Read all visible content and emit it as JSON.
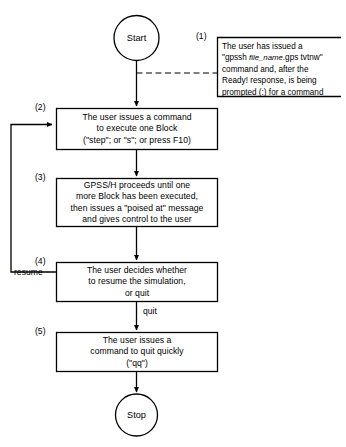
{
  "diagram": {
    "background_color": "#ffffff",
    "line_color": "#000000"
  },
  "terminals": {
    "start": "Start",
    "stop": "Stop"
  },
  "steps": [
    {
      "number": "(1)",
      "kind": "note",
      "lines_html": [
        "The user has issued a",
        "\"gpssh <i>file_name</i>.gps tvtnw\"",
        "command and, after the",
        "Ready! response, is being",
        "prompted (:) for a command"
      ],
      "lines_text": [
        "The user has issued a",
        "\"gpssh file_name.gps tvtnw\"",
        "command and, after the",
        "Ready! response, is being",
        "prompted (:) for a command"
      ]
    },
    {
      "number": "(2)",
      "kind": "process",
      "lines": [
        "The user  issues a command",
        "to execute one Block",
        "(\"step\"; or \"s\"; or press F10)"
      ]
    },
    {
      "number": "(3)",
      "kind": "process",
      "lines": [
        "GPSS/H proceeds until one",
        "more Block has been executed,",
        "then issues a \"poised at\" message",
        "and gives control to the user"
      ]
    },
    {
      "number": "(4)",
      "kind": "process",
      "lines": [
        "The user decides whether",
        "to resume the simulation,",
        "or quit"
      ]
    },
    {
      "number": "(5)",
      "kind": "process",
      "lines": [
        "The user issues a",
        "command to quit quickly",
        "(\"qq\")"
      ]
    }
  ],
  "edge_labels": {
    "resume": "resume",
    "quit": "quit"
  }
}
